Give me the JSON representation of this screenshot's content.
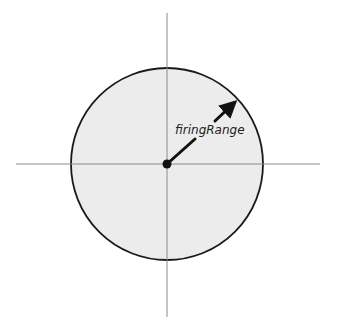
{
  "diagram": {
    "type": "range-circle",
    "label": "firingRange",
    "colors": {
      "background": "#ffffff",
      "circle_fill": "#ececec",
      "circle_stroke": "#1a1a1a",
      "axis": "#8a8a8a",
      "arrow": "#111111",
      "center_dot": "#111111"
    },
    "center": {
      "x": 167,
      "y": 164
    },
    "radius": 96,
    "axes": {
      "horizontal": {
        "x1": 16,
        "x2": 320,
        "y": 164
      },
      "vertical": {
        "x": 167,
        "y1": 13,
        "y2": 317
      }
    },
    "arrow": {
      "from": {
        "x": 167,
        "y": 164
      },
      "to": {
        "x": 237,
        "y": 100
      }
    }
  }
}
